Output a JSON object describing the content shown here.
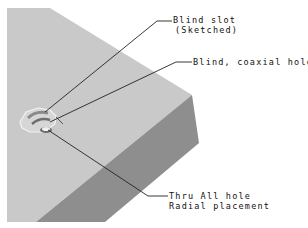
{
  "diagram": {
    "type": "isometric-part-callout",
    "colors": {
      "top_face": "#c9c9c9",
      "side_face": "#8e8e8e",
      "leader": "#222222",
      "background": "#ffffff"
    },
    "callouts": [
      {
        "id": "blind-slot",
        "lines": [
          "Blind slot",
          "(Sketched)"
        ]
      },
      {
        "id": "blind-coaxial-hole",
        "lines": [
          "Blind, coaxial hole"
        ]
      },
      {
        "id": "thru-all-hole",
        "lines": [
          "Thru All hole",
          "Radial placement"
        ]
      }
    ]
  }
}
